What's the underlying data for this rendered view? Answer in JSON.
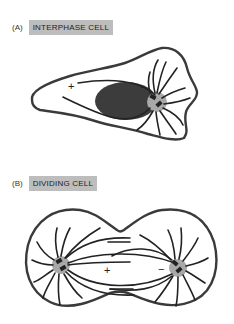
{
  "panels": [
    {
      "letter": "(A)",
      "title": "INTERPHASE CELL",
      "plus": "+",
      "minus": "−"
    },
    {
      "letter": "(B)",
      "title": "DIVIDING CELL",
      "plus": "+",
      "minus": "−"
    }
  ],
  "colors": {
    "membrane": "#3a3a3a",
    "nucleus": "#3c3c3c",
    "centrosome": "#a8a8a8",
    "label_bg": "#bdbdbd"
  }
}
